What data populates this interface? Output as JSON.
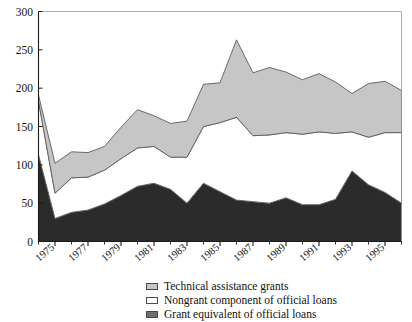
{
  "chart_data": {
    "type": "area",
    "stacked": true,
    "title": "",
    "subtitle": "",
    "xlabel": "",
    "ylabel": "",
    "ylim": [
      0,
      300
    ],
    "ytick_values": [
      0,
      50,
      100,
      150,
      200,
      250,
      300
    ],
    "ytick_labels": [
      "0",
      "50",
      "100",
      "150",
      "200",
      "250",
      "300"
    ],
    "grid": false,
    "legend_position": "bottom",
    "x": [
      1974,
      1975,
      1976,
      1977,
      1978,
      1979,
      1980,
      1981,
      1982,
      1983,
      1984,
      1985,
      1986,
      1987,
      1988,
      1989,
      1990,
      1991,
      1992,
      1993,
      1994,
      1995,
      1996
    ],
    "xtick_labels": [
      "1975",
      "1977",
      "1979",
      "1981",
      "1983",
      "1985",
      "1987",
      "1989",
      "1991",
      "1993",
      "1995"
    ],
    "xtick_values": [
      1975,
      1977,
      1979,
      1981,
      1983,
      1985,
      1987,
      1989,
      1991,
      1993,
      1995
    ],
    "xlim": [
      1974,
      1996
    ],
    "series": [
      {
        "name": "Grant equivalent of official loans",
        "color": "#2b2b2b",
        "stack_order": 1,
        "values": [
          113,
          30,
          38,
          41,
          49,
          60,
          72,
          76,
          68,
          50,
          76,
          65,
          54,
          52,
          50,
          57,
          48,
          48,
          55,
          92,
          74,
          64,
          50
        ]
      },
      {
        "name": "Nongrant component of official loans",
        "color": "#ffffff",
        "stack_order": 2,
        "values": [
          70,
          33,
          45,
          43,
          44,
          48,
          50,
          48,
          42,
          60,
          74,
          90,
          108,
          86,
          89,
          85,
          92,
          95,
          86,
          51,
          62,
          78,
          92
        ]
      },
      {
        "name": "Technical assistance grants",
        "color": "#c6c6c6",
        "stack_order": 3,
        "values": [
          8,
          39,
          34,
          32,
          31,
          41,
          50,
          40,
          44,
          47,
          55,
          52,
          101,
          82,
          88,
          79,
          71,
          76,
          67,
          50,
          70,
          67,
          55
        ]
      }
    ],
    "cumulative_totals": [
      191,
      102,
      117,
      116,
      124,
      149,
      172,
      164,
      154,
      157,
      205,
      207,
      263,
      220,
      227,
      221,
      211,
      219,
      208,
      193,
      206,
      209,
      197
    ]
  },
  "legend": {
    "items": [
      {
        "label": "Technical assistance grants",
        "swatch": "#c6c6c6"
      },
      {
        "label": "Nongrant component of official loans",
        "swatch": "#ffffff"
      },
      {
        "label": "Grant equivalent of official loans",
        "swatch": "#6e6e6e"
      }
    ]
  }
}
